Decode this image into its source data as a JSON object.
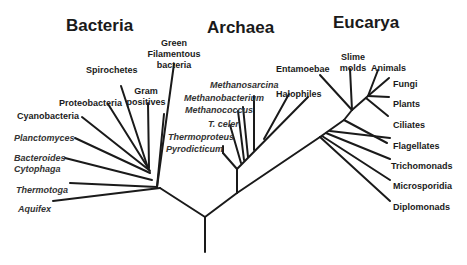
{
  "domains": {
    "bacteria": "Bacteria",
    "archaea": "Archaea",
    "eucarya": "Eucarya"
  },
  "bacteria_taxa": {
    "green": "Green",
    "filamentous": "Filamentous",
    "bacteria_word": "bacteria",
    "spirochetes": "Spirochetes",
    "gram": "Gram",
    "positives": "positives",
    "proteobacteria": "Proteobacteria",
    "cyanobacteria": "Cyanobacteria",
    "planctomyces": "Planctomyces",
    "bacteroides": "Bacteroides",
    "cytophaga": "Cytophaga",
    "thermotoga": "Thermotoga",
    "aquifex": "Aquifex"
  },
  "archaea_taxa": {
    "methanosarcina": "Methanosarcina",
    "methanobacterium": "Methanobacterium",
    "methanococcus": "Methanococcus",
    "t_celer": "T. celer",
    "thermoproteus": "Thermoproteus",
    "pyrodicticum": "Pyrodicticum",
    "halophiles": "Halophiles"
  },
  "eucarya_taxa": {
    "entamoebae": "Entamoebae",
    "slime": "Slime",
    "molds": "molds",
    "animals": "Animals",
    "fungi": "Fungi",
    "plants": "Plants",
    "ciliates": "Ciliates",
    "flagellates": "Flagellates",
    "trichomonads": "Trichomonads",
    "microsporidia": "Microsporidia",
    "diplomonads": "Diplomonads"
  },
  "colors": {
    "line": "#1a1a1a",
    "background": "#ffffff"
  }
}
